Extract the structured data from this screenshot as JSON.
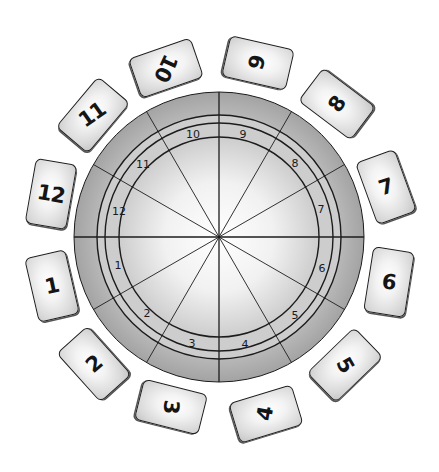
{
  "diagram": {
    "colors": {
      "background": "#ffffff",
      "outer_band": "#a9a9a9",
      "outer_band_light": "#c2c2c2",
      "ring_band": "#cdcdcd",
      "inner_center": "#ffffff",
      "inner_edge": "#cfcfcf",
      "line": "#1c1c1c"
    },
    "wheel": {
      "center": [
        219,
        237
      ],
      "outer_radius": 145,
      "ring_radii": [
        122,
        114,
        100
      ],
      "spoke_angles_deg": [
        0,
        30,
        60,
        90,
        120,
        150,
        180,
        210,
        240,
        270,
        300,
        330
      ]
    },
    "house_numbers": [
      {
        "label": "1",
        "x": 118,
        "y": 265
      },
      {
        "label": "2",
        "x": 147,
        "y": 313
      },
      {
        "label": "3",
        "x": 192,
        "y": 343
      },
      {
        "label": "4",
        "x": 245,
        "y": 344
      },
      {
        "label": "5",
        "x": 295,
        "y": 315
      },
      {
        "label": "6",
        "x": 322,
        "y": 268
      },
      {
        "label": "7",
        "x": 321,
        "y": 209
      },
      {
        "label": "8",
        "x": 295,
        "y": 163
      },
      {
        "label": "9",
        "x": 243,
        "y": 134
      },
      {
        "label": "10",
        "x": 193,
        "y": 134
      },
      {
        "label": "11",
        "x": 143,
        "y": 164
      },
      {
        "label": "12",
        "x": 119,
        "y": 211
      }
    ],
    "cards": [
      {
        "label": "1",
        "cx": 52,
        "cy": 286,
        "rot": -13,
        "text_rot": -12
      },
      {
        "label": "2",
        "cx": 94,
        "cy": 364,
        "rot": -42,
        "text_rot": -40
      },
      {
        "label": "3",
        "cx": 171,
        "cy": 407,
        "rot": 104,
        "text_rot": 95
      },
      {
        "label": "4",
        "cx": 266,
        "cy": 414,
        "rot": 73,
        "text_rot": -80
      },
      {
        "label": "5",
        "cx": 345,
        "cy": 365,
        "rot": 46,
        "text_rot": 60
      },
      {
        "label": "6",
        "cx": 389,
        "cy": 282,
        "rot": 9,
        "text_rot": 8
      },
      {
        "label": "7",
        "cx": 386,
        "cy": 187,
        "rot": -20,
        "text_rot": -18
      },
      {
        "label": "8",
        "cx": 337,
        "cy": 104,
        "rot": -53,
        "text_rot": -55
      },
      {
        "label": "9",
        "cx": 258,
        "cy": 63,
        "rot": 103,
        "text_rot": -75
      },
      {
        "label": "10",
        "cx": 166,
        "cy": 68,
        "rot": 71,
        "text_rot": 115
      },
      {
        "label": "11",
        "cx": 93,
        "cy": 115,
        "rot": 40,
        "text_rot": -35
      },
      {
        "label": "12",
        "cx": 51,
        "cy": 194,
        "rot": 10,
        "text_rot": 10
      }
    ],
    "card_size": {
      "w": 42,
      "h": 66
    }
  }
}
